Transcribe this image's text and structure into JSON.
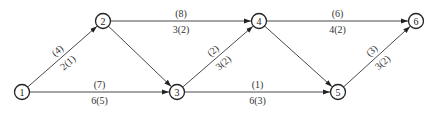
{
  "diagram": {
    "type": "directed-network",
    "nodes": [
      {
        "id": "1",
        "label": "1"
      },
      {
        "id": "2",
        "label": "2"
      },
      {
        "id": "3",
        "label": "3"
      },
      {
        "id": "4",
        "label": "4"
      },
      {
        "id": "5",
        "label": "5"
      },
      {
        "id": "6",
        "label": "6"
      }
    ],
    "edges": [
      {
        "from": "1",
        "to": "2",
        "upper": "(4)",
        "lower": "2(1)"
      },
      {
        "from": "1",
        "to": "3",
        "upper": "(7)",
        "lower": "6(5)"
      },
      {
        "from": "2",
        "to": "4",
        "upper": "(8)",
        "lower": "3(2)"
      },
      {
        "from": "2",
        "to": "3",
        "upper": "",
        "lower": ""
      },
      {
        "from": "3",
        "to": "4",
        "upper": "(2)",
        "lower": "3(2)"
      },
      {
        "from": "3",
        "to": "5",
        "upper": "(1)",
        "lower": "6(3)"
      },
      {
        "from": "4",
        "to": "6",
        "upper": "(6)",
        "lower": "4(2)"
      },
      {
        "from": "4",
        "to": "5",
        "upper": "",
        "lower": ""
      },
      {
        "from": "5",
        "to": "6",
        "upper": "(3)",
        "lower": "3(2)"
      }
    ]
  }
}
